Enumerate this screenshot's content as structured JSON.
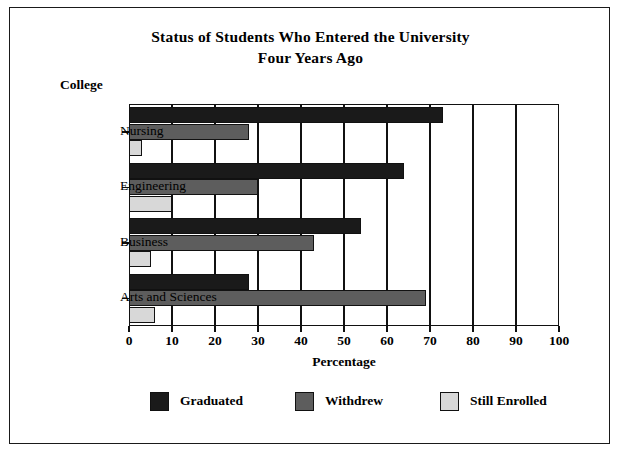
{
  "chart_data": {
    "type": "bar",
    "orientation": "horizontal",
    "title": "Status of Students Who Entered the University Four Years Ago",
    "title_line1": "Status of Students Who Entered the University",
    "title_line2": "Four Years Ago",
    "xlabel": "Percentage",
    "ylabel": "College",
    "categories": [
      "Nursing",
      "Engineering",
      "Business",
      "Arts and Sciences"
    ],
    "series": [
      {
        "name": "Graduated",
        "color": "#1a1a1a",
        "values": [
          73,
          64,
          54,
          28
        ]
      },
      {
        "name": "Withdrew",
        "color": "#5d5d5d",
        "values": [
          28,
          30,
          43,
          69
        ]
      },
      {
        "name": "Still Enrolled",
        "color": "#d8d8d8",
        "values": [
          3,
          10,
          5,
          6
        ]
      }
    ],
    "xlim": [
      0,
      100
    ],
    "xticks": [
      0,
      10,
      20,
      30,
      40,
      50,
      60,
      70,
      80,
      90,
      100
    ],
    "xtick_labels": [
      "0",
      "10",
      "20",
      "30",
      "40",
      "50",
      "60",
      "70",
      "80",
      "90",
      "100"
    ],
    "grid": "vertical",
    "legend_position": "bottom"
  }
}
